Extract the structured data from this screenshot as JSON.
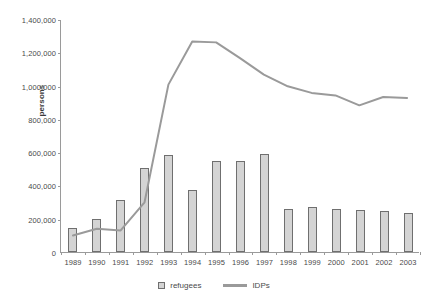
{
  "chart_data": {
    "type": "bar",
    "title": "",
    "xlabel": "",
    "ylabel": "persons",
    "ylim": [
      0,
      1400000
    ],
    "ytick_step": 200000,
    "ytick_labels": [
      "0",
      "200,000",
      "400,000",
      "600,000",
      "800,000",
      "1,000,000",
      "1,200,000",
      "1,400,000"
    ],
    "ytick_values": [
      0,
      200000,
      400000,
      600000,
      800000,
      1000000,
      1200000,
      1400000
    ],
    "grid": false,
    "legend_position": "bottom",
    "categories": [
      "1989",
      "1990",
      "1991",
      "1992",
      "1993",
      "1994",
      "1995",
      "1996",
      "1997",
      "1998",
      "1999",
      "2000",
      "2001",
      "2002",
      "2003"
    ],
    "series": [
      {
        "name": "refugees",
        "kind": "bar",
        "color": "#d4d4d4",
        "border_color": "#6f6f6f",
        "values": [
          145000,
          200000,
          310000,
          505000,
          580000,
          370000,
          545000,
          545000,
          590000,
          260000,
          270000,
          260000,
          255000,
          245000,
          235000
        ]
      },
      {
        "name": "IDPs",
        "kind": "line",
        "color": "#9a9a9a",
        "values": [
          100000,
          140000,
          130000,
          300000,
          1010000,
          1270000,
          1265000,
          1170000,
          1070000,
          1000000,
          960000,
          945000,
          885000,
          935000,
          930000
        ]
      }
    ]
  },
  "legend": {
    "items": [
      {
        "label": "refugees",
        "type": "bar-swatch"
      },
      {
        "label": "IDPs",
        "type": "line-swatch"
      }
    ]
  }
}
